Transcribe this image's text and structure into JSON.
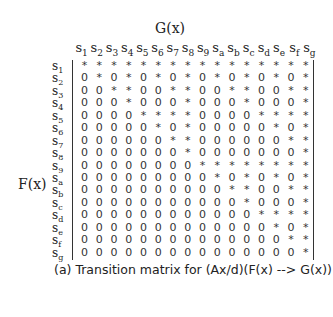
{
  "figure": {
    "col_label": "G(x)",
    "row_label": "F(x)",
    "caption": "(a) Transition matrix for (Ax/d)(F(x) --> G(x))",
    "states": [
      "1",
      "2",
      "3",
      "4",
      "5",
      "6",
      "7",
      "8",
      "9",
      "a",
      "b",
      "c",
      "d",
      "e",
      "f",
      "g"
    ],
    "matrix": [
      "****************",
      "0*0*0*0*0*0*0*0*",
      "00**00**00**00**",
      "000*000*000*000*",
      "0000****0000****",
      "00000*0*00000*0*",
      "000000**000000**",
      "0000000*0000000*",
      "00000000********",
      "000000000*0*0*0*",
      "0000000000**00**",
      "00000000000*000*",
      "000000000000****",
      "0000000000000*0*",
      "00000000000000**",
      "000000000000000*"
    ]
  }
}
